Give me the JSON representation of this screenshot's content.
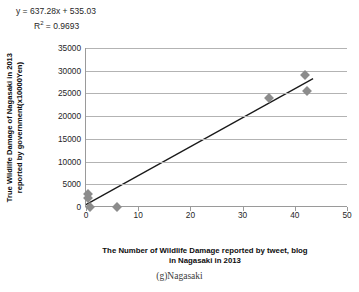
{
  "annotation": {
    "equation": "y = 637.28x + 535.03",
    "r_squared": "R",
    "r_squared_exp": "2",
    "r_squared_value": " = 0.9693"
  },
  "axes": {
    "y_title_line1": "True Wildlife Damage of Nagasaki in 2013",
    "y_title_line2": "reported by government(x10000Yen)",
    "x_title_line1": "The Number of Wildlife Damage reported by tweet, blog",
    "x_title_line2": "in Nagasaki in 2013"
  },
  "caption": "(g)Nagasaki",
  "chart_data": {
    "type": "scatter",
    "title": "",
    "xlabel": "The Number of Wildlife Damage reported by tweet, blog in Nagasaki in 2013",
    "ylabel": "True Wildlife Damage of Nagasaki in 2013 reported by government(x10000Yen)",
    "xlim": [
      0,
      50
    ],
    "ylim": [
      0,
      35000
    ],
    "xticks": [
      0,
      10,
      20,
      30,
      40,
      50
    ],
    "yticks": [
      0,
      5000,
      10000,
      15000,
      20000,
      25000,
      30000,
      35000
    ],
    "grid": "horizontal",
    "legend": "none",
    "marker_color": "#8c8c8c",
    "marker_shape": "diamond",
    "line_color": "#1a1a1a",
    "points": [
      {
        "x": 0.4,
        "y": 2900
      },
      {
        "x": 0.4,
        "y": 1900
      },
      {
        "x": 0.8,
        "y": 0
      },
      {
        "x": 6.0,
        "y": 0
      },
      {
        "x": 35.0,
        "y": 24000
      },
      {
        "x": 42.0,
        "y": 29000
      },
      {
        "x": 42.3,
        "y": 25500
      }
    ],
    "trendline": {
      "slope": 637.28,
      "intercept": 535.03,
      "x_start": 0.0,
      "x_end": 43.5,
      "equation": "y = 637.28x + 535.03",
      "r_squared": 0.9693
    }
  }
}
